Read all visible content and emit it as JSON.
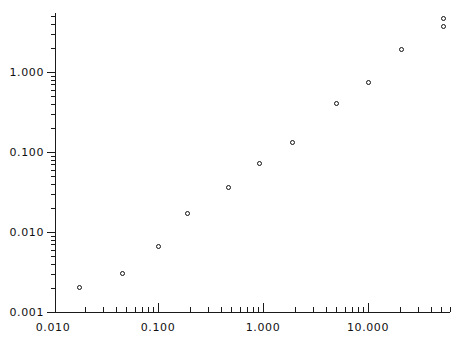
{
  "chart_data": {
    "type": "scatter",
    "title": "",
    "subtitle": "",
    "xlabel": "",
    "ylabel": "",
    "xscale": "log",
    "yscale": "log",
    "grid": false,
    "legend": null,
    "xlim": [
      0.01,
      50.0
    ],
    "ylim": [
      0.001,
      5.0
    ],
    "x_tick_labels": [
      "0.010",
      "0.100",
      "1.000",
      "10.000"
    ],
    "x_tick_values": [
      0.01,
      0.1,
      1.0,
      10.0
    ],
    "y_tick_labels": [
      "1.000",
      "0.100",
      "0.010",
      "0.001"
    ],
    "y_tick_values": [
      1.0,
      0.1,
      0.01,
      0.001
    ],
    "marker_style": "open-circle",
    "marker_color": "#111111",
    "series": [
      {
        "name": "data",
        "points": [
          {
            "x": 0.018,
            "y": 0.002
          },
          {
            "x": 0.046,
            "y": 0.003
          },
          {
            "x": 0.1,
            "y": 0.0066
          },
          {
            "x": 0.19,
            "y": 0.017
          },
          {
            "x": 0.47,
            "y": 0.036
          },
          {
            "x": 0.93,
            "y": 0.072
          },
          {
            "x": 1.9,
            "y": 0.13
          },
          {
            "x": 5.0,
            "y": 0.4
          },
          {
            "x": 10.0,
            "y": 0.73
          },
          {
            "x": 21.0,
            "y": 1.9
          },
          {
            "x": 52.0,
            "y": 4.6
          },
          {
            "x": 52.0,
            "y": 3.7
          }
        ]
      }
    ]
  },
  "axes": {
    "x_axis_name": "x-axis",
    "y_axis_name": "y-axis",
    "x_minor_ticks_per_decade": 9,
    "y_minor_ticks_per_decade": 9
  }
}
